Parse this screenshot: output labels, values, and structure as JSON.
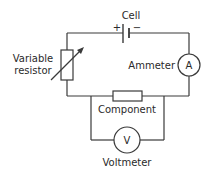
{
  "diagram": {
    "type": "circuit",
    "labels": {
      "cell": "Cell",
      "cell_plus": "+",
      "cell_minus": "−",
      "variable_resistor_line1": "Variable",
      "variable_resistor_line2": "resistor",
      "ammeter": "Ammeter",
      "ammeter_symbol": "A",
      "component": "Component",
      "voltmeter": "Voltmeter",
      "voltmeter_symbol": "V"
    },
    "components": [
      {
        "id": "cell",
        "kind": "cell",
        "position": "top"
      },
      {
        "id": "variable-resistor",
        "kind": "variable resistor",
        "position": "left"
      },
      {
        "id": "ammeter",
        "kind": "ammeter",
        "position": "right"
      },
      {
        "id": "component",
        "kind": "resistor",
        "position": "bottom"
      },
      {
        "id": "voltmeter",
        "kind": "voltmeter",
        "position": "parallel with component"
      }
    ],
    "colors": {
      "line": "#3a3a3a",
      "text": "#2a2a2a",
      "background": "#ffffff"
    }
  }
}
